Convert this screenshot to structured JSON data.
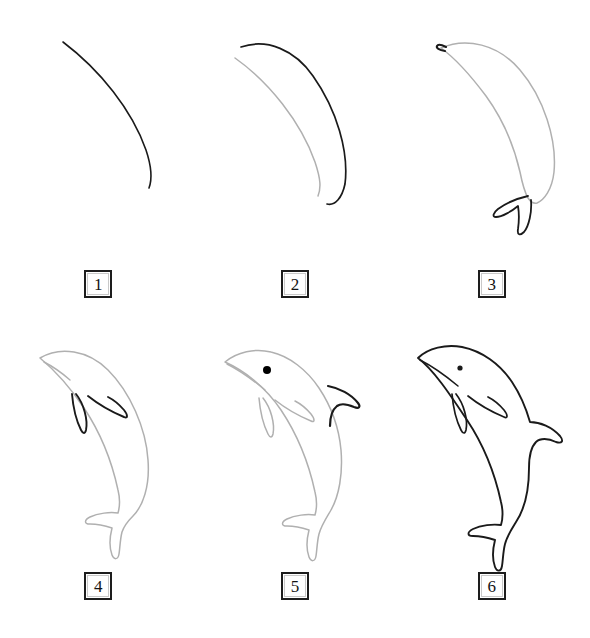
{
  "page": {
    "background_color": "#ffffff",
    "width": 590,
    "height": 638,
    "style": "line-art drawing tutorial",
    "columns": 3,
    "rows": 2
  },
  "colors": {
    "new_stroke": "#1a1a1a",
    "previous_stroke": "#b0b0b0",
    "eye_fill": "#000000",
    "box_border": "#1d1d1d",
    "box_inner_border": "#c9c9c9",
    "background": "#ffffff"
  },
  "steps": [
    {
      "number": "1",
      "label": "1",
      "name": "step-1",
      "description": "Single long curved arc forming the dolphin's back",
      "new_parts": [
        "back-curve"
      ],
      "previous_parts": []
    },
    {
      "number": "2",
      "label": "2",
      "name": "step-2",
      "description": "Second outer curve added to form the belly side of the crescent body",
      "new_parts": [
        "outer-body-curve"
      ],
      "previous_parts": [
        "back-curve"
      ]
    },
    {
      "number": "3",
      "label": "3",
      "name": "step-3",
      "description": "Body outline closed with pointed beak tip and tail fluke",
      "new_parts": [
        "beak-tip",
        "tail-fluke"
      ],
      "previous_parts": [
        "body-outline"
      ]
    },
    {
      "number": "4",
      "label": "4",
      "name": "step-4",
      "description": "Pectoral flippers and mouth line added",
      "new_parts": [
        "near-flipper",
        "far-flipper",
        "mouth-line"
      ],
      "previous_parts": [
        "body-outline",
        "tail-fluke"
      ]
    },
    {
      "number": "5",
      "label": "5",
      "name": "step-5",
      "description": "Dorsal fin and eye added",
      "new_parts": [
        "dorsal-fin",
        "eye"
      ],
      "previous_parts": [
        "body-outline",
        "tail-fluke",
        "flippers",
        "mouth-line"
      ]
    },
    {
      "number": "6",
      "label": "6",
      "name": "step-6",
      "description": "Completed dolphin with all lines inked in dark",
      "new_parts": [
        "full-dolphin"
      ],
      "previous_parts": []
    }
  ]
}
